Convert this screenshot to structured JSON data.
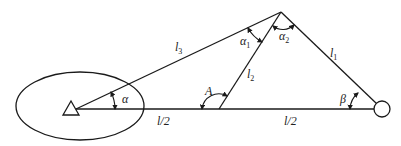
{
  "diagram": {
    "type": "surveying-triangle",
    "colors": {
      "line": "#1a1a1a",
      "background": "#ffffff",
      "text": "#222222"
    },
    "nodes": {
      "station": {
        "shape": "triangle",
        "x": 76,
        "y": 109
      },
      "target": {
        "shape": "circle",
        "x": 382,
        "y": 109,
        "r": 8
      },
      "apex": {
        "x": 281,
        "y": 12
      },
      "midpoint": {
        "x": 219,
        "y": 109
      }
    },
    "ellipse": {
      "cx": 80,
      "cy": 106,
      "rx": 64,
      "ry": 34
    },
    "labels": {
      "l3": {
        "main": "l",
        "sub": "3"
      },
      "l2": {
        "main": "l",
        "sub": "2"
      },
      "l1": {
        "main": "l",
        "sub": "1"
      },
      "alpha1": {
        "main": "α",
        "sub": "1"
      },
      "alpha2": {
        "main": "α",
        "sub": "2"
      },
      "alpha": "α",
      "A": "A",
      "beta": "β",
      "half_left": "l/2",
      "half_right": "l/2"
    }
  }
}
